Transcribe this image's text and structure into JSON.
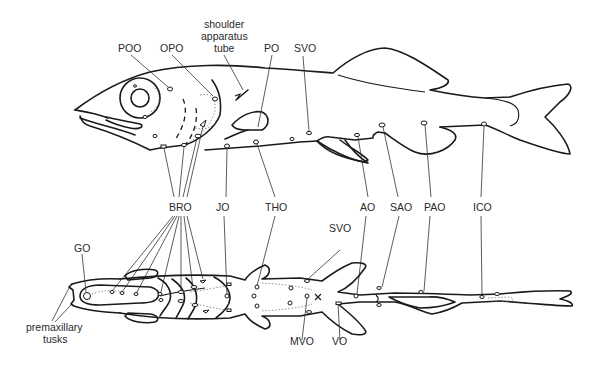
{
  "figure": {
    "colors": {
      "line": "#1a1a1a",
      "text": "#2a2a2a",
      "background": "#ffffff"
    }
  },
  "lateral_view": {
    "labels": {
      "poo": "POO",
      "opo": "OPO",
      "shoulder_1": "shoulder",
      "shoulder_2": "apparatus",
      "shoulder_3": "tube",
      "po": "PO",
      "svo": "SVO"
    }
  },
  "middle_labels": {
    "bro": "BRO",
    "jo": "JO",
    "tho": "THO",
    "ao": "AO",
    "sao": "SAO",
    "pao": "PAO",
    "ico": "ICO"
  },
  "ventral_view": {
    "labels": {
      "go": "GO",
      "svo": "SVO",
      "premax_1": "premaxillary",
      "premax_2": "tusks",
      "mvo": "MVO",
      "vo": "VO"
    }
  }
}
